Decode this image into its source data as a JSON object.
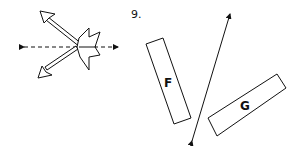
{
  "question_number": "9.",
  "figure_left": {
    "description": "Two double-headed arrows crossing a dashed horizontal line with a fletched (arrow-tail) shape",
    "dashed_line": true
  },
  "figure_right": {
    "line": "double-headed line",
    "shapes": [
      {
        "label": "F"
      },
      {
        "label": "G"
      }
    ]
  },
  "colors": {
    "stroke": "#111111",
    "background": "#ffffff"
  }
}
